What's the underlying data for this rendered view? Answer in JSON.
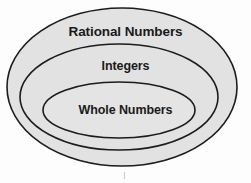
{
  "diagram": {
    "kind": "nested-ellipse-venn",
    "background_color": "#fdfdfd",
    "fill_color": "#e2e2e2",
    "stroke_color": "#1c1c1c",
    "text_color": "#1a1a1a",
    "sets": [
      {
        "id": "rational",
        "label": "Rational Numbers",
        "level": 0,
        "cx": 122,
        "cy": 87,
        "rx": 115,
        "ry": 79
      },
      {
        "id": "integers",
        "label": "Integers",
        "level": 1,
        "cx": 119,
        "cy": 97,
        "rx": 99,
        "ry": 53
      },
      {
        "id": "whole",
        "label": "Whole Numbers",
        "level": 2,
        "cx": 119,
        "cy": 110,
        "rx": 76,
        "ry": 28
      }
    ],
    "tick": {
      "label": "bottom-tick-mark"
    }
  }
}
